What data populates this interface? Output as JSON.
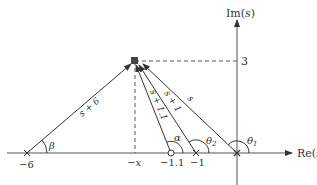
{
  "diagram": {
    "type": "s-plane vector diagram",
    "axes": {
      "real_label": "Re(s)",
      "imag_label": "Im(s)",
      "imag_tick": "3"
    },
    "point": {
      "label_x": "−x",
      "imag_value": "3",
      "marker": "filled-square"
    },
    "poles_zeros": [
      {
        "kind": "pole",
        "marker": "cross",
        "label": "−6"
      },
      {
        "kind": "zero",
        "marker": "circle",
        "label": "−1.1"
      },
      {
        "kind": "pole",
        "marker": "cross",
        "label": "−1"
      },
      {
        "kind": "pole",
        "marker": "cross",
        "label": ""
      }
    ],
    "vectors": [
      {
        "label": "s + 6",
        "angle_label": "β"
      },
      {
        "label": "s + 1.1",
        "angle_label": "α"
      },
      {
        "label": "s + 1",
        "angle_label": "θ2"
      },
      {
        "label": "s",
        "angle_label": "θ1"
      }
    ],
    "colors": {
      "line": "#333333",
      "marker": "#444444"
    }
  }
}
